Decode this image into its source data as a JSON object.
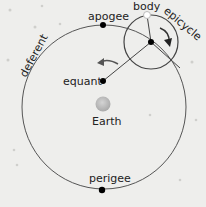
{
  "diagram": {
    "type": "ptolemaic-model",
    "labels": {
      "apogee": "apogee",
      "perigee": "perigee",
      "equant": "equant",
      "earth": "Earth",
      "body": "body",
      "epicycle": "epicycle",
      "deferent": "deferent"
    },
    "colors": {
      "background": "#eeeeec",
      "line": "#444444",
      "dot": "#000000",
      "earth": "#bdbdbd",
      "arrow": "#333333"
    }
  }
}
